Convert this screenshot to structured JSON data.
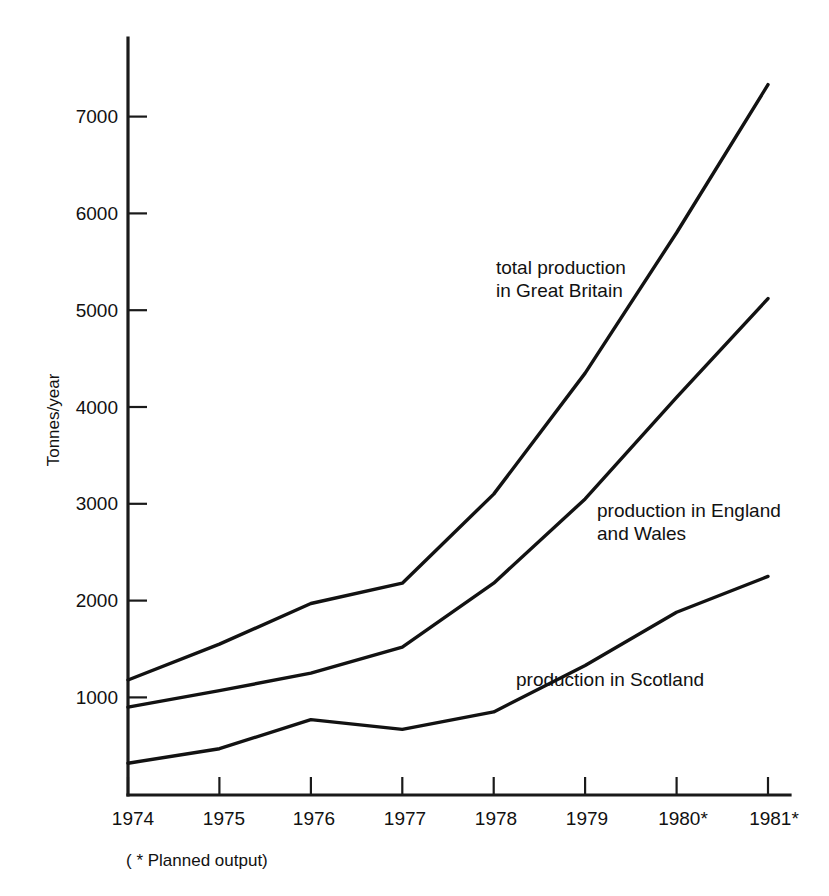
{
  "chart_data": {
    "type": "line",
    "title": "",
    "subtitle": "",
    "xlabel": "",
    "ylabel": "Tonnes/year",
    "x": [
      "1974",
      "1975",
      "1976",
      "1977",
      "1978",
      "1979",
      "1980*",
      "1981*"
    ],
    "categories": [
      "1974",
      "1975",
      "1976",
      "1977",
      "1978",
      "1979",
      "1980*",
      "1981*"
    ],
    "xtick_labels": [
      "1974",
      "1975",
      "1976",
      "1977",
      "1978",
      "1979",
      "1980*",
      "1981*"
    ],
    "ytick_labels": [
      "1000",
      "2000",
      "3000",
      "4000",
      "5000",
      "6000",
      "7000"
    ],
    "ytick_values": [
      1000,
      2000,
      3000,
      4000,
      5000,
      6000,
      7000
    ],
    "ylim": [
      0,
      7700
    ],
    "grid": false,
    "legend_position": "inline-annotations",
    "series": [
      {
        "name": "total production in Great Britain",
        "label_line1": "total production",
        "label_line2": "in Great Britain",
        "values": [
          1180,
          1550,
          1970,
          2180,
          3100,
          4350,
          5800,
          7330
        ]
      },
      {
        "name": "production in England and Wales",
        "label_line1": "production in England",
        "label_line2": "and Wales",
        "values": [
          900,
          1070,
          1250,
          1520,
          2180,
          3050,
          4100,
          5120
        ]
      },
      {
        "name": "production in Scotland",
        "label_line1": "production in Scotland",
        "label_line2": "",
        "values": [
          320,
          470,
          770,
          670,
          850,
          1330,
          1880,
          2250
        ]
      }
    ],
    "annotations": [
      {
        "text": "total production in Great Britain"
      },
      {
        "text": "production in England and Wales"
      },
      {
        "text": "production in Scotland"
      }
    ],
    "footnote": "( * Planned output)",
    "colors": {
      "line": "#121212",
      "axis": "#1a1a1a",
      "background": "#ffffff",
      "text": "#111111"
    }
  },
  "figure": {
    "ylabel": "Tonnes/year",
    "footnote": "( * Planned output)",
    "series_labels": {
      "total_l1": "total production",
      "total_l2": "in Great Britain",
      "ew_l1": "production in England",
      "ew_l2": "and Wales",
      "scotland_l1": "production in Scotland"
    },
    "yticks": {
      "t1000": "1000",
      "t2000": "2000",
      "t3000": "3000",
      "t4000": "4000",
      "t5000": "5000",
      "t6000": "6000",
      "t7000": "7000"
    },
    "xticks": {
      "x1974": "1974",
      "x1975": "1975",
      "x1976": "1976",
      "x1977": "1977",
      "x1978": "1978",
      "x1979": "1979",
      "x1980": "1980*",
      "x1981": "1981*"
    }
  }
}
